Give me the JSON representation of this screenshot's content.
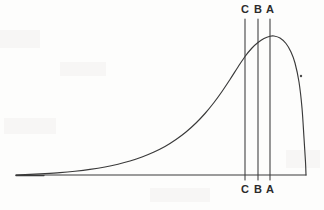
{
  "figure": {
    "background_color": "#fdfdfc",
    "ink_color": "#3a3a3a",
    "label_color": "#2b2b2b"
  },
  "markers": [
    {
      "id": "C",
      "top_label": "C",
      "bottom_label": "C",
      "x": 245,
      "line_top_y": 19,
      "line_bottom_y": 180
    },
    {
      "id": "B",
      "top_label": "B",
      "bottom_label": "B",
      "x": 258,
      "line_top_y": 19,
      "line_bottom_y": 180
    },
    {
      "id": "A",
      "top_label": "A",
      "bottom_label": "A",
      "x": 270,
      "line_top_y": 19,
      "line_bottom_y": 180
    }
  ],
  "labels": {
    "top_row_y": 4,
    "bottom_row_y": 184
  },
  "chart_data": {
    "type": "line",
    "title": "",
    "subtitle": "",
    "xlabel": "",
    "ylabel": "",
    "grid": false,
    "legend": null,
    "axis": {
      "baseline_y_px": 175,
      "baseline_x_start_px": 16,
      "baseline_x_end_px": 306,
      "xlim_px": [
        16,
        306
      ],
      "ylim_px": [
        175,
        36
      ]
    },
    "series": [
      {
        "name": "density",
        "description": "Negatively skewed (left-tailed) unimodal density curve: long flat tail on the left, peak near the right, steep drop to the baseline at the right edge.",
        "peak_px": {
          "x": 272,
          "y": 36
        },
        "points_px": [
          {
            "x": 16,
            "y": 175
          },
          {
            "x": 30,
            "y": 174.4
          },
          {
            "x": 45,
            "y": 173.6
          },
          {
            "x": 60,
            "y": 172.6
          },
          {
            "x": 75,
            "y": 171.2
          },
          {
            "x": 90,
            "y": 169.4
          },
          {
            "x": 105,
            "y": 167.0
          },
          {
            "x": 118,
            "y": 164.2
          },
          {
            "x": 130,
            "y": 161.0
          },
          {
            "x": 142,
            "y": 157.0
          },
          {
            "x": 154,
            "y": 152.0
          },
          {
            "x": 165,
            "y": 146.5
          },
          {
            "x": 176,
            "y": 139.5
          },
          {
            "x": 186,
            "y": 132.0
          },
          {
            "x": 196,
            "y": 123.0
          },
          {
            "x": 205,
            "y": 113.5
          },
          {
            "x": 214,
            "y": 102.5
          },
          {
            "x": 222,
            "y": 91.5
          },
          {
            "x": 230,
            "y": 79.5
          },
          {
            "x": 238,
            "y": 67.0
          },
          {
            "x": 245,
            "y": 56.5
          },
          {
            "x": 252,
            "y": 48.0
          },
          {
            "x": 258,
            "y": 42.5
          },
          {
            "x": 264,
            "y": 38.5
          },
          {
            "x": 270,
            "y": 36.2
          },
          {
            "x": 274,
            "y": 36.0
          },
          {
            "x": 280,
            "y": 38.0
          },
          {
            "x": 286,
            "y": 43.5
          },
          {
            "x": 291,
            "y": 52.0
          },
          {
            "x": 295,
            "y": 63.0
          },
          {
            "x": 299,
            "y": 82.0
          },
          {
            "x": 302,
            "y": 108.0
          },
          {
            "x": 304,
            "y": 138.0
          },
          {
            "x": 305.5,
            "y": 162.0
          },
          {
            "x": 306,
            "y": 175
          }
        ]
      }
    ],
    "annotations": [
      {
        "name": "marker-C",
        "label": "C",
        "x_px": 245,
        "note": "leftmost vertical reference line"
      },
      {
        "name": "marker-B",
        "label": "B",
        "x_px": 258,
        "note": "middle vertical reference line"
      },
      {
        "name": "marker-A",
        "label": "A",
        "x_px": 270,
        "note": "rightmost vertical reference line, at the curve peak"
      },
      {
        "name": "stray-dot",
        "x_px": 301,
        "y_px": 76,
        "note": "small scan speck to the right of the falling limb"
      }
    ]
  }
}
